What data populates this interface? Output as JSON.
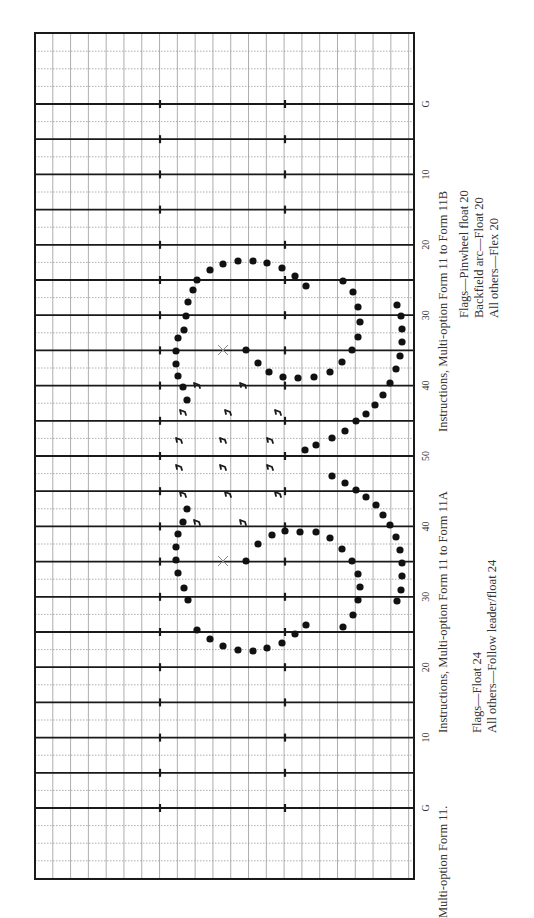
{
  "figure": {
    "title": "Multi-option Form 11.",
    "instructions_a": {
      "heading": "Instructions, Multi-option Form 11 to Form 11A",
      "lines": [
        "Flags—Float 24",
        "All others—Follow leader/float 24"
      ]
    },
    "instructions_b": {
      "heading": "Instructions, Multi-option Form 11 to Form 11B",
      "lines": [
        "Flags—Pinwheel float 20",
        "Backfield arc—Float 20",
        "All others—Flex 20"
      ]
    }
  },
  "field": {
    "yard_labels": [
      "G",
      "10",
      "20",
      "30",
      "40",
      "50",
      "40",
      "30",
      "20",
      "10",
      "G"
    ],
    "colors": {
      "ink": "#1a1a1a",
      "grid": "#999999",
      "dots": "#111111",
      "marker": "#888888"
    }
  },
  "chart_data": {
    "type": "scatter",
    "title": "Multi-option Form 11",
    "yard_line_y": {
      "G_top": 104,
      "10_top": 174,
      "20_top": 245,
      "30_top": 315,
      "40_top": 386,
      "50": 456,
      "40_bottom": 528,
      "30_bottom": 597,
      "20_bottom": 668,
      "10_bottom": 738,
      "G_bottom": 808
    },
    "series": [
      {
        "name": "Marchers (dots)",
        "marker": "dot",
        "points": [
          [
            184,
            330
          ],
          [
            186,
            316
          ],
          [
            188,
            302
          ],
          [
            193,
            290
          ],
          [
            197,
            280
          ],
          [
            210,
            270
          ],
          [
            223,
            264
          ],
          [
            238,
            261
          ],
          [
            253,
            261
          ],
          [
            267,
            263
          ],
          [
            282,
            268
          ],
          [
            295,
            276
          ],
          [
            306,
            286
          ],
          [
            178,
            338
          ],
          [
            176,
            351
          ],
          [
            176,
            364
          ],
          [
            178,
            376
          ],
          [
            183,
            387
          ],
          [
            187,
            400
          ],
          [
            246,
            350
          ],
          [
            258,
            363
          ],
          [
            269,
            372
          ],
          [
            283,
            377
          ],
          [
            298,
            378
          ],
          [
            314,
            377
          ],
          [
            330,
            372
          ],
          [
            342,
            362
          ],
          [
            352,
            350
          ],
          [
            358,
            337
          ],
          [
            360,
            322
          ],
          [
            358,
            307
          ],
          [
            353,
            292
          ],
          [
            343,
            281
          ],
          [
            397,
            305
          ],
          [
            401,
            316
          ],
          [
            402,
            329
          ],
          [
            402,
            342
          ],
          [
            400,
            356
          ],
          [
            396,
            369
          ],
          [
            390,
            383
          ],
          [
            383,
            395
          ],
          [
            375,
            405
          ],
          [
            366,
            414
          ],
          [
            356,
            421
          ],
          [
            345,
            431
          ],
          [
            332,
            438
          ],
          [
            316,
            445
          ],
          [
            305,
            450
          ],
          [
            332,
            476
          ],
          [
            345,
            483
          ],
          [
            356,
            490
          ],
          [
            366,
            497
          ],
          [
            376,
            505
          ],
          [
            383,
            515
          ],
          [
            390,
            525
          ],
          [
            396,
            537
          ],
          [
            400,
            550
          ],
          [
            402,
            563
          ],
          [
            402,
            576
          ],
          [
            401,
            590
          ],
          [
            397,
            601
          ],
          [
            343,
            627
          ],
          [
            353,
            615
          ],
          [
            358,
            600
          ],
          [
            360,
            587
          ],
          [
            358,
            574
          ],
          [
            352,
            561
          ],
          [
            342,
            549
          ],
          [
            330,
            538
          ],
          [
            316,
            532
          ],
          [
            300,
            532
          ],
          [
            285,
            531
          ],
          [
            272,
            535
          ],
          [
            258,
            544
          ],
          [
            246,
            561
          ],
          [
            187,
            509
          ],
          [
            183,
            522
          ],
          [
            178,
            534
          ],
          [
            176,
            547
          ],
          [
            176,
            560
          ],
          [
            178,
            573
          ],
          [
            184,
            588
          ],
          [
            188,
            600
          ],
          [
            197,
            630
          ],
          [
            210,
            639
          ],
          [
            223,
            646
          ],
          [
            238,
            650
          ],
          [
            253,
            651
          ],
          [
            267,
            648
          ],
          [
            282,
            643
          ],
          [
            295,
            634
          ],
          [
            306,
            625
          ]
        ]
      },
      {
        "name": "Flags",
        "marker": "flag",
        "points": [
          [
            197,
            386
          ],
          [
            243,
            386
          ],
          [
            183,
            413
          ],
          [
            228,
            413
          ],
          [
            278,
            413
          ],
          [
            179,
            441
          ],
          [
            223,
            441
          ],
          [
            270,
            441
          ],
          [
            179,
            468
          ],
          [
            223,
            468
          ],
          [
            270,
            468
          ],
          [
            183,
            495
          ],
          [
            228,
            495
          ],
          [
            278,
            495
          ],
          [
            197,
            523
          ],
          [
            243,
            523
          ]
        ]
      },
      {
        "name": "Pivot points (X)",
        "marker": "x",
        "points": [
          [
            223,
            350
          ],
          [
            223,
            561
          ]
        ]
      }
    ]
  }
}
